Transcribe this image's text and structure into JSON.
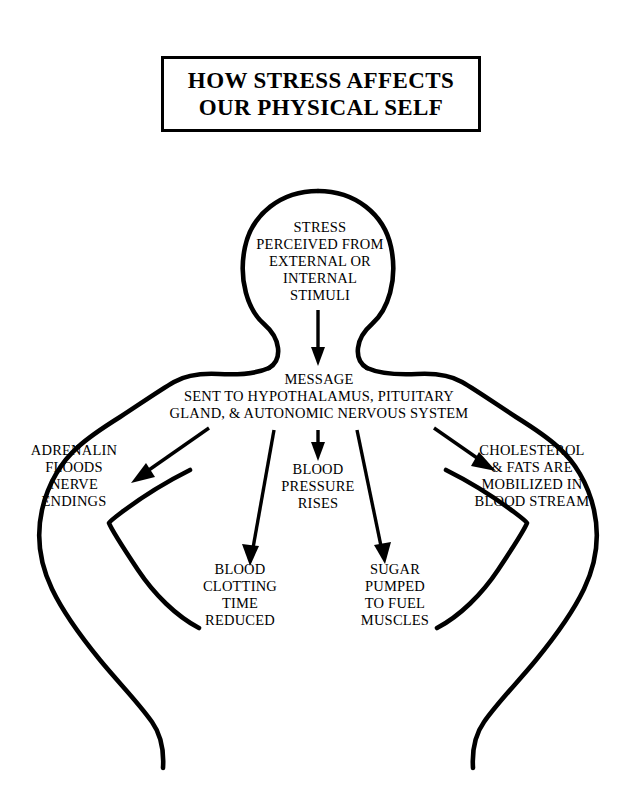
{
  "title": {
    "line1": "HOW STRESS AFFECTS",
    "line2": "OUR PHYSICAL SELF"
  },
  "diagram": {
    "figure_label": "human-body-outline",
    "nodes": {
      "stress": {
        "id": "stress-perceived",
        "location": "head",
        "lines": [
          "STRESS",
          "PERCEIVED FROM",
          "EXTERNAL OR",
          "INTERNAL",
          "STIMULI"
        ]
      },
      "message": {
        "id": "message-sent",
        "location": "upper-chest",
        "lines": [
          "MESSAGE",
          "SENT TO HYPOTHALAMUS, PITUITARY",
          "GLAND, & AUTONOMIC NERVOUS SYSTEM"
        ]
      },
      "adrenalin": {
        "id": "adrenalin-floods",
        "location": "left-shoulder-outer",
        "lines": [
          "ADRENALIN",
          "FLOODS",
          "NERVE",
          "ENDINGS"
        ]
      },
      "blood_pressure": {
        "id": "blood-pressure-rises",
        "location": "center-chest",
        "lines": [
          "BLOOD",
          "PRESSURE",
          "RISES"
        ]
      },
      "cholesterol": {
        "id": "cholesterol-mobilized",
        "location": "right-shoulder-outer",
        "lines": [
          "CHOLESTEROL",
          "& FATS ARE",
          "MOBILIZED IN",
          "BLOOD STREAM"
        ]
      },
      "clotting": {
        "id": "blood-clotting-time-reduced",
        "location": "left-abdomen",
        "lines": [
          "BLOOD",
          "CLOTTING",
          "TIME",
          "REDUCED"
        ]
      },
      "sugar": {
        "id": "sugar-pumped-to-fuel-muscles",
        "location": "right-abdomen",
        "lines": [
          "SUGAR",
          "PUMPED",
          "TO FUEL",
          "MUSCLES"
        ]
      }
    },
    "arrows": [
      {
        "name": "arrow-stress-to-message",
        "from": "stress",
        "to": "message",
        "direction": "down"
      },
      {
        "name": "arrow-message-to-adrenalin",
        "from": "message",
        "to": "adrenalin",
        "direction": "down-left"
      },
      {
        "name": "arrow-message-to-clotting",
        "from": "message",
        "to": "clotting",
        "direction": "down"
      },
      {
        "name": "arrow-message-to-bp",
        "from": "message",
        "to": "blood_pressure",
        "direction": "down"
      },
      {
        "name": "arrow-message-to-sugar",
        "from": "message",
        "to": "sugar",
        "direction": "down-right"
      },
      {
        "name": "arrow-message-to-cholesterol",
        "from": "message",
        "to": "cholesterol",
        "direction": "down-right"
      }
    ],
    "colors": {
      "ink": "#000000",
      "paper": "#ffffff"
    }
  }
}
